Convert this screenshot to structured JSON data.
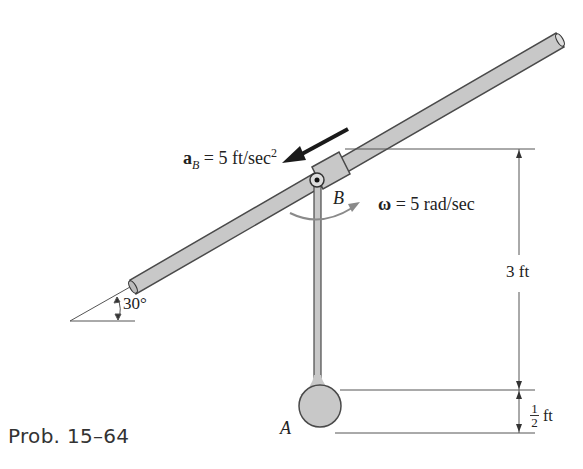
{
  "caption": "Prob. 15–64",
  "labels": {
    "accel_symbol": "a",
    "accel_subscript": "B",
    "accel_rest": " = 5 ft/sec",
    "accel_exp": "2",
    "omega_symbol": "ω",
    "omega_rest": " = 5 rad/sec",
    "point_b": "B",
    "point_a": "A",
    "angle": "30°",
    "dim_rod": "3 ft",
    "dim_ball_num": "1",
    "dim_ball_den": "2",
    "dim_ball_unit": "ft"
  },
  "colors": {
    "rod_fill": "#c8c8c8",
    "rod_stroke": "#4a4a4a",
    "arrow": "#1a1a1a",
    "omega_arrow": "#8a8a8a",
    "dim_line": "#555555"
  }
}
